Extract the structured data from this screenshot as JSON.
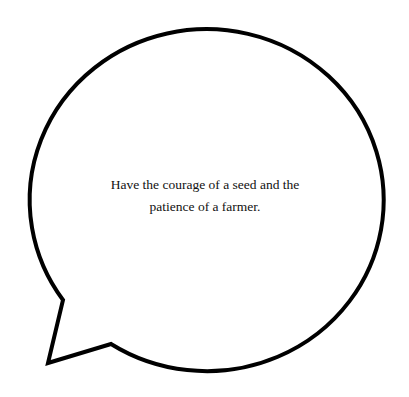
{
  "speech_bubble": {
    "quote": "Have the courage of a seed and the patience of a farmer.",
    "stroke_color": "#000000",
    "fill_color": "#ffffff"
  }
}
